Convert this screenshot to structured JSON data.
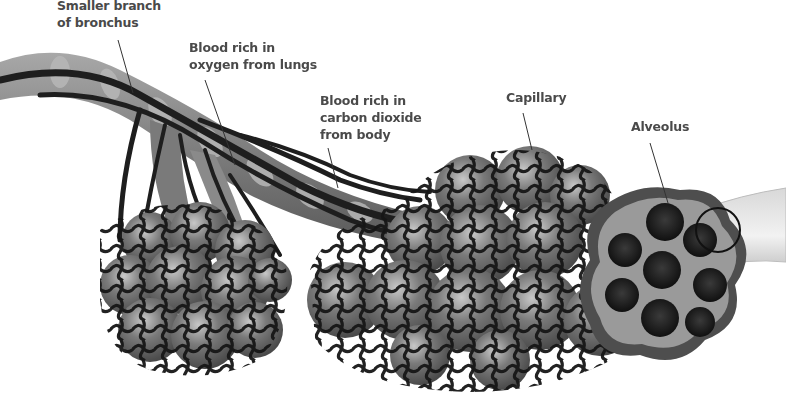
{
  "diagram": {
    "labels": [
      {
        "id": "bronchus",
        "line1": "Smaller branch",
        "line2": "of bronchus",
        "line3": ""
      },
      {
        "id": "oxygen",
        "line1": "Blood rich in",
        "line2": "oxygen from lungs",
        "line3": ""
      },
      {
        "id": "co2",
        "line1": "Blood rich in",
        "line2": "carbon dioxide",
        "line3": "from body"
      },
      {
        "id": "capillary",
        "line1": "Capillary",
        "line2": "",
        "line3": ""
      },
      {
        "id": "alveolus",
        "line1": "Alveolus",
        "line2": "",
        "line3": ""
      }
    ]
  },
  "colors": {
    "label_text": "#4a4a4a",
    "vessel": "#1e1e1e",
    "alveolus_fill": "#6a6a6a",
    "alveolus_light": "#9a9a9a",
    "bronchus": "#8c8c8c",
    "bronchus_ring": "#b4b4b4"
  }
}
